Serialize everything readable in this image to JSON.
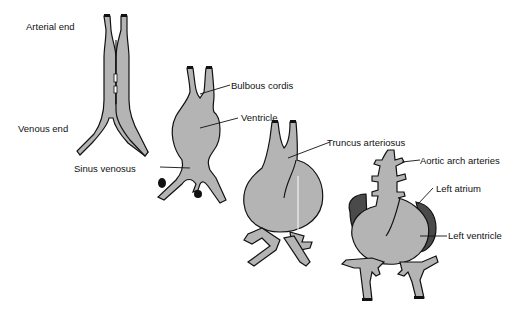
{
  "diagram": {
    "colors": {
      "tissue": "#b4b4b4",
      "atrium_dark": "#4a4a4a",
      "outline": "#111111",
      "background": "#ffffff"
    },
    "stages": [
      {
        "id": "stage-1",
        "description": "Paired heart tubes fusing"
      },
      {
        "id": "stage-2",
        "description": "Single heart tube with bulges"
      },
      {
        "id": "stage-3",
        "description": "Looping heart tube"
      },
      {
        "id": "stage-4",
        "description": "Four-chambered heart forming"
      }
    ],
    "labels": {
      "arterial_end": "Arterial end",
      "venous_end": "Venous end",
      "sinus_venosus": "Sinus venosus",
      "bulbous_cordis": "Bulbous cordis",
      "ventricle": "Ventricle",
      "truncus_arteriosus": "Truncus arteriosus",
      "aortic_arch_arteries": "Aortic arch arteries",
      "left_atrium": "Left atrium",
      "left_ventricle": "Left ventricle"
    }
  }
}
